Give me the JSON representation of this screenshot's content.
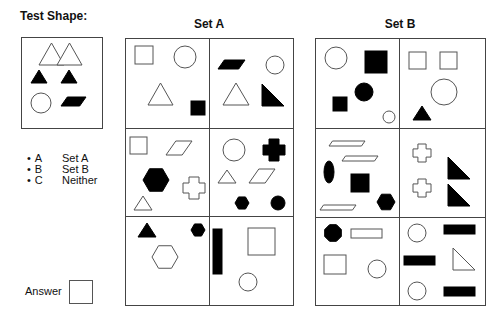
{
  "titles": {
    "test_shape": "Test Shape:",
    "set_a": "Set A",
    "set_b": "Set B"
  },
  "legend": [
    {
      "key": "A",
      "label": "Set A"
    },
    {
      "key": "B",
      "label": "Set B"
    },
    {
      "key": "C",
      "label": "Neither"
    }
  ],
  "answer": {
    "label": "Answer",
    "value": ""
  },
  "colors": {
    "stroke": "#555555",
    "fill_black": "#000000",
    "outline_fill": "#ffffff"
  },
  "boxes": {
    "test": {
      "x": 21,
      "y": 37,
      "w": 81,
      "h": 91
    },
    "set_a": {
      "x": 125,
      "y": 38,
      "w": 168,
      "h": 267,
      "col_x": 209,
      "row_y": [
        128,
        216
      ]
    },
    "set_b": {
      "x": 315,
      "y": 38,
      "w": 170,
      "h": 267,
      "col_x": 399,
      "row_y": [
        128,
        217
      ]
    }
  },
  "test_shape": [
    {
      "type": "triangle",
      "fill": "outline",
      "x": 39,
      "y": 43,
      "w": 25,
      "h": 22
    },
    {
      "type": "triangle",
      "fill": "outline",
      "x": 57,
      "y": 43,
      "w": 25,
      "h": 22
    },
    {
      "type": "triangle",
      "fill": "black",
      "x": 31,
      "y": 70,
      "w": 16,
      "h": 13
    },
    {
      "type": "triangle",
      "fill": "black",
      "x": 61,
      "y": 70,
      "w": 16,
      "h": 13
    },
    {
      "type": "circle",
      "fill": "outline",
      "cx": 41,
      "cy": 103,
      "r": 10
    },
    {
      "type": "parallelogram",
      "fill": "black",
      "x": 61,
      "y": 97,
      "w": 25,
      "h": 9
    }
  ],
  "set_a": [
    {
      "cell": "r1c1",
      "shapes": [
        {
          "type": "square",
          "fill": "outline",
          "x": 135,
          "y": 46,
          "w": 18,
          "h": 18
        },
        {
          "type": "circle",
          "fill": "outline",
          "cx": 185,
          "cy": 57,
          "r": 11
        },
        {
          "type": "triangle",
          "fill": "outline",
          "x": 148,
          "y": 83,
          "w": 25,
          "h": 22
        },
        {
          "type": "square",
          "fill": "black",
          "x": 191,
          "y": 101,
          "w": 14,
          "h": 14
        }
      ]
    },
    {
      "cell": "r1c2",
      "shapes": [
        {
          "type": "parallelogram",
          "fill": "black",
          "x": 218,
          "y": 60,
          "w": 27,
          "h": 9
        },
        {
          "type": "circle",
          "fill": "outline",
          "cx": 275,
          "cy": 65,
          "r": 9
        },
        {
          "type": "triangle",
          "fill": "outline",
          "x": 223,
          "y": 83,
          "w": 26,
          "h": 22
        },
        {
          "type": "right-triangle",
          "fill": "black",
          "x": 262,
          "y": 84,
          "w": 22,
          "h": 22
        }
      ]
    },
    {
      "cell": "r2c1",
      "shapes": [
        {
          "type": "square",
          "fill": "outline",
          "x": 130,
          "y": 137,
          "w": 17,
          "h": 17
        },
        {
          "type": "parallelogram",
          "fill": "outline",
          "x": 166,
          "y": 141,
          "w": 26,
          "h": 14
        },
        {
          "type": "hexagon",
          "fill": "black",
          "cx": 156,
          "cy": 180,
          "r": 13
        },
        {
          "type": "cross",
          "fill": "outline",
          "cx": 194,
          "cy": 188,
          "s": 22
        },
        {
          "type": "triangle",
          "fill": "outline",
          "x": 134,
          "y": 196,
          "w": 18,
          "h": 14
        }
      ]
    },
    {
      "cell": "r2c2",
      "shapes": [
        {
          "type": "circle",
          "fill": "outline",
          "cx": 234,
          "cy": 150,
          "r": 11
        },
        {
          "type": "cross",
          "fill": "black",
          "cx": 274,
          "cy": 150,
          "s": 22
        },
        {
          "type": "triangle",
          "fill": "outline",
          "x": 218,
          "y": 170,
          "w": 18,
          "h": 13
        },
        {
          "type": "parallelogram",
          "fill": "outline",
          "x": 249,
          "y": 169,
          "w": 26,
          "h": 14
        },
        {
          "type": "hexagon",
          "fill": "black",
          "cx": 242,
          "cy": 203,
          "r": 7
        },
        {
          "type": "circle",
          "fill": "black",
          "cx": 278,
          "cy": 203,
          "r": 7
        }
      ]
    },
    {
      "cell": "r3c1",
      "shapes": [
        {
          "type": "triangle",
          "fill": "black",
          "x": 138,
          "y": 223,
          "w": 18,
          "h": 14
        },
        {
          "type": "hexagon",
          "fill": "black",
          "cx": 198,
          "cy": 230,
          "r": 7
        },
        {
          "type": "hexagon",
          "fill": "outline",
          "cx": 165,
          "cy": 257,
          "r": 13
        },
        {
          "type": "none"
        }
      ]
    },
    {
      "cell": "r3c2",
      "shapes": [
        {
          "type": "rect",
          "fill": "black",
          "x": 213,
          "y": 229,
          "w": 9,
          "h": 45
        },
        {
          "type": "square",
          "fill": "outline",
          "x": 248,
          "y": 228,
          "w": 27,
          "h": 27
        },
        {
          "type": "circle",
          "fill": "outline",
          "cx": 248,
          "cy": 282,
          "r": 9
        }
      ]
    }
  ],
  "set_b": [
    {
      "cell": "r1c1",
      "shapes": [
        {
          "type": "circle",
          "fill": "outline",
          "cx": 336,
          "cy": 58,
          "r": 11
        },
        {
          "type": "square",
          "fill": "black",
          "x": 365,
          "y": 51,
          "w": 22,
          "h": 22
        },
        {
          "type": "circle",
          "fill": "black",
          "cx": 364,
          "cy": 92,
          "r": 9
        },
        {
          "type": "square",
          "fill": "black",
          "x": 333,
          "y": 97,
          "w": 14,
          "h": 14
        },
        {
          "type": "circle",
          "fill": "outline",
          "cx": 389,
          "cy": 117,
          "r": 6
        }
      ]
    },
    {
      "cell": "r1c2",
      "shapes": [
        {
          "type": "square",
          "fill": "outline",
          "x": 409,
          "y": 52,
          "w": 17,
          "h": 17
        },
        {
          "type": "square",
          "fill": "outline",
          "x": 440,
          "y": 52,
          "w": 17,
          "h": 17
        },
        {
          "type": "circle",
          "fill": "outline",
          "cx": 444,
          "cy": 92,
          "r": 13
        },
        {
          "type": "triangle",
          "fill": "black",
          "x": 413,
          "y": 106,
          "w": 18,
          "h": 14
        }
      ]
    },
    {
      "cell": "r2c1",
      "shapes": [
        {
          "type": "parallelogram",
          "fill": "outline",
          "x": 329,
          "y": 141,
          "w": 36,
          "h": 5
        },
        {
          "type": "parallelogram",
          "fill": "outline",
          "x": 342,
          "y": 156,
          "w": 36,
          "h": 5
        },
        {
          "type": "ellipse",
          "fill": "black",
          "cx": 329,
          "cy": 172,
          "rx": 5,
          "ry": 11
        },
        {
          "type": "square",
          "fill": "black",
          "x": 351,
          "y": 174,
          "w": 18,
          "h": 18
        },
        {
          "type": "hexagon",
          "fill": "black",
          "cx": 386,
          "cy": 202,
          "r": 9
        },
        {
          "type": "parallelogram",
          "fill": "outline",
          "x": 320,
          "y": 205,
          "w": 36,
          "h": 5
        }
      ]
    },
    {
      "cell": "r2c2",
      "shapes": [
        {
          "type": "cross",
          "fill": "outline",
          "cx": 422,
          "cy": 153,
          "s": 18
        },
        {
          "type": "right-triangle",
          "fill": "black",
          "x": 448,
          "y": 157,
          "w": 22,
          "h": 22
        },
        {
          "type": "cross",
          "fill": "outline",
          "cx": 422,
          "cy": 188,
          "s": 18
        },
        {
          "type": "right-triangle",
          "fill": "black",
          "x": 448,
          "y": 184,
          "w": 22,
          "h": 22
        }
      ]
    },
    {
      "cell": "r3c1",
      "shapes": [
        {
          "type": "octagon",
          "fill": "black",
          "cx": 333,
          "cy": 233,
          "r": 9
        },
        {
          "type": "rect",
          "fill": "outline",
          "x": 351,
          "y": 229,
          "w": 31,
          "h": 9
        },
        {
          "type": "square",
          "fill": "outline",
          "x": 324,
          "y": 255,
          "w": 22,
          "h": 19
        },
        {
          "type": "circle",
          "fill": "outline",
          "cx": 377,
          "cy": 269,
          "r": 9
        }
      ]
    },
    {
      "cell": "r3c2",
      "shapes": [
        {
          "type": "circle",
          "fill": "outline",
          "cx": 417,
          "cy": 233,
          "r": 9
        },
        {
          "type": "rect",
          "fill": "black",
          "x": 444,
          "y": 225,
          "w": 31,
          "h": 9
        },
        {
          "type": "rect",
          "fill": "black",
          "x": 404,
          "y": 256,
          "w": 31,
          "h": 9
        },
        {
          "type": "right-triangle-outline",
          "fill": "outline",
          "x": 453,
          "y": 248,
          "w": 22,
          "h": 22
        },
        {
          "type": "circle",
          "fill": "outline",
          "cx": 417,
          "cy": 291,
          "r": 9
        },
        {
          "type": "rect",
          "fill": "black",
          "x": 444,
          "y": 287,
          "w": 31,
          "h": 9
        }
      ]
    }
  ]
}
